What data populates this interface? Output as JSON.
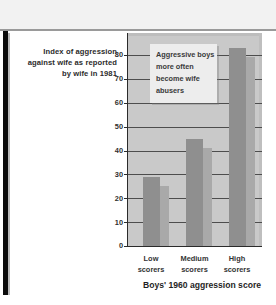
{
  "figure": {
    "y_axis_caption_lines": [
      "Index of aggression",
      "against wife as reported",
      "by wife in 1981"
    ],
    "x_axis_title": "Boys' 1960 aggression score",
    "callout_lines": [
      "Aggressive boys",
      "more often",
      "become wife",
      "abusers"
    ],
    "colors": {
      "plot_background": "#c9c9c9",
      "bar_fill": "#8f8f8f",
      "bar_shadow": "#a9a9a9",
      "gridline": "#4d4d4d",
      "axis": "#2b2b2b",
      "callout_background": "#ededed",
      "page_background": "#ffffff",
      "top_band": "#f2f2f2",
      "left_rule": "#0b0b0b"
    }
  },
  "chart_data": {
    "type": "bar",
    "title": "",
    "annotation": "Aggressive boys more often become wife abusers",
    "categories": [
      "Low scorers",
      "Medium scorers",
      "High scorers"
    ],
    "category_lines": [
      [
        "Low",
        "scorers"
      ],
      [
        "Medium",
        "scorers"
      ],
      [
        "High",
        "scorers"
      ]
    ],
    "values": [
      29,
      45,
      83
    ],
    "xlabel": "Boys' 1960 aggression score",
    "ylabel": "Index of aggression against wife as reported by wife in 1981",
    "ylim": [
      0,
      85
    ],
    "yticks": [
      0,
      10,
      20,
      30,
      40,
      50,
      60,
      70,
      80
    ],
    "ytick_labels": [
      "0",
      "10",
      "20",
      "30",
      "40",
      "50",
      "60",
      "70",
      "80"
    ],
    "grid": true,
    "legend": "none"
  }
}
